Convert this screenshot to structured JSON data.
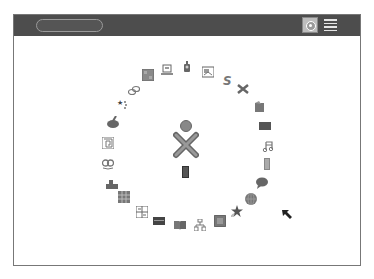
{
  "frame": {
    "search": {
      "value": "",
      "placeholder": ""
    },
    "views": [
      {
        "name": "home-view",
        "active": true
      },
      {
        "name": "list-view",
        "active": false
      }
    ]
  },
  "home": {
    "center": {
      "icon": "xo-buddy-icon",
      "journal_icon": "journal-icon"
    },
    "activities": [
      {
        "name": "grid-square",
        "icon": "grid-icon",
        "x": 148,
        "y": 75
      },
      {
        "name": "chat",
        "icon": "laptop-chat-icon",
        "x": 167,
        "y": 70
      },
      {
        "name": "turtle-art",
        "icon": "robot-icon",
        "x": 187,
        "y": 67
      },
      {
        "name": "image-viewer",
        "icon": "image-icon",
        "x": 208,
        "y": 72
      },
      {
        "name": "scratch",
        "icon": "scratch-s-icon",
        "x": 228,
        "y": 80
      },
      {
        "name": "tools",
        "icon": "tools-icon",
        "x": 243,
        "y": 89
      },
      {
        "name": "write",
        "icon": "pencil-doc-icon",
        "x": 259,
        "y": 107
      },
      {
        "name": "terminal",
        "icon": "dark-rect-icon",
        "x": 265,
        "y": 126
      },
      {
        "name": "music",
        "icon": "music-note-icon",
        "x": 268,
        "y": 146
      },
      {
        "name": "calculate",
        "icon": "calculator-icon",
        "x": 267,
        "y": 164
      },
      {
        "name": "speak",
        "icon": "speech-bubble-icon",
        "x": 262,
        "y": 183
      },
      {
        "name": "browse",
        "icon": "globe-icon",
        "x": 251,
        "y": 199
      },
      {
        "name": "star-activity",
        "icon": "star-icon",
        "x": 237,
        "y": 211
      },
      {
        "name": "record",
        "icon": "record-box-icon",
        "x": 220,
        "y": 221
      },
      {
        "name": "network",
        "icon": "tree-network-icon",
        "x": 200,
        "y": 225
      },
      {
        "name": "read",
        "icon": "book-icon",
        "x": 180,
        "y": 225
      },
      {
        "name": "panel",
        "icon": "dark-panel-icon",
        "x": 159,
        "y": 221
      },
      {
        "name": "abacus",
        "icon": "abacus-icon",
        "x": 142,
        "y": 212
      },
      {
        "name": "memorize",
        "icon": "grid3x3-icon",
        "x": 124,
        "y": 197
      },
      {
        "name": "blocks",
        "icon": "blocks-icon",
        "x": 112,
        "y": 184
      },
      {
        "name": "eyes",
        "icon": "eyes-icon",
        "x": 108,
        "y": 164
      },
      {
        "name": "maze",
        "icon": "maze-icon",
        "x": 108,
        "y": 143
      },
      {
        "name": "paint",
        "icon": "palette-icon",
        "x": 113,
        "y": 122
      },
      {
        "name": "stars",
        "icon": "stars-icon",
        "x": 123,
        "y": 104
      },
      {
        "name": "chain",
        "icon": "chain-icon",
        "x": 134,
        "y": 90
      }
    ]
  },
  "cursor": {
    "icon": "arrow-pointer-icon"
  }
}
